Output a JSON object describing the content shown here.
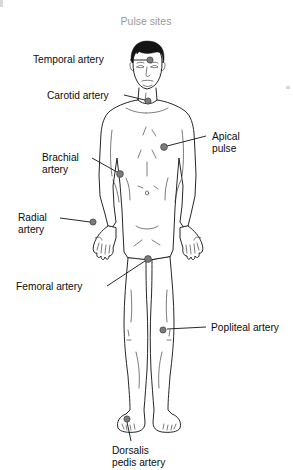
{
  "figure": {
    "title": "Pulse sites",
    "title_color": "#9a9a9a",
    "background_color": "#ffffff",
    "line_color": "#1a1a1a",
    "dot_color": "#7b7b7b"
  },
  "labels": [
    {
      "id": "temporal-artery",
      "line1": "Temporal artery",
      "line2": "",
      "text_x": 33,
      "text_y": 63,
      "align": "start",
      "leader": "M 130 60 L 147 60",
      "dot_x": 150,
      "dot_y": 60
    },
    {
      "id": "carotid-artery",
      "line1": "Carotid artery",
      "line2": "",
      "text_x": 47,
      "text_y": 99,
      "align": "start",
      "leader": "M 124 95 L 145 100",
      "dot_x": 148,
      "dot_y": 101
    },
    {
      "id": "apical-pulse",
      "line1": "Apical",
      "line2": "pulse",
      "text_x": 212,
      "text_y": 140,
      "align": "start",
      "leader": "M 206 136 L 167 146",
      "dot_x": 164,
      "dot_y": 147
    },
    {
      "id": "brachial-artery",
      "line1": "Brachial",
      "line2": "artery",
      "text_x": 42,
      "text_y": 161,
      "align": "start",
      "leader": "M 92 158 L 117 172",
      "dot_x": 120,
      "dot_y": 174
    },
    {
      "id": "radial-artery",
      "line1": "Radial",
      "line2": "artery",
      "text_x": 18,
      "text_y": 221,
      "align": "start",
      "leader": "M 60 218 L 90 222",
      "dot_x": 93,
      "dot_y": 222
    },
    {
      "id": "femoral-artery",
      "line1": "Femoral artery",
      "line2": "",
      "text_x": 16,
      "text_y": 290,
      "align": "start",
      "leader": "M 107 286 L 145 261",
      "dot_x": 148,
      "dot_y": 259
    },
    {
      "id": "popliteal-artery",
      "line1": "Popliteal artery",
      "line2": "",
      "text_x": 211,
      "text_y": 331,
      "align": "start",
      "leader": "M 206 327 L 167 329",
      "dot_x": 163,
      "dot_y": 330
    },
    {
      "id": "dorsalis-pedis-artery",
      "line1": "Dorsalis",
      "line2": "pedis artery",
      "text_x": 112,
      "text_y": 454,
      "align": "start",
      "leader": "M 131 441 L 127 422",
      "dot_x": 127,
      "dot_y": 419
    }
  ]
}
